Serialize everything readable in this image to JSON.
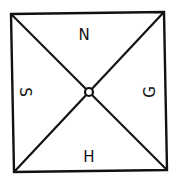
{
  "diagram": {
    "type": "square-divided-by-diagonals",
    "labels": {
      "top": "N",
      "right": "G",
      "bottom": "H",
      "left": "S"
    },
    "center_marker": "small-circle",
    "colors": {
      "stroke": "#111111",
      "background": "#ffffff"
    }
  }
}
